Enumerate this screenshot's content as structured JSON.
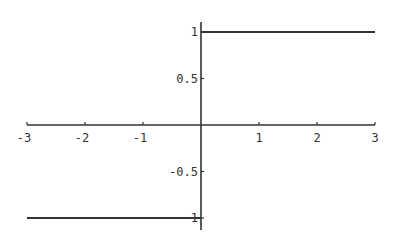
{
  "chart_data": {
    "type": "line",
    "title": "",
    "xlabel": "",
    "ylabel": "",
    "xlim": [
      -3,
      3
    ],
    "ylim": [
      -1,
      1
    ],
    "grid": false,
    "legend": null,
    "axes_origin": [
      0,
      0
    ],
    "x_ticks": [
      -3,
      -2,
      -1,
      1,
      2,
      3
    ],
    "x_tick_labels": [
      "-3",
      "-2",
      "-1",
      "1",
      "2",
      "3"
    ],
    "y_ticks": [
      1,
      0.5,
      -0.5,
      -1
    ],
    "y_tick_labels": [
      "1",
      "0.5",
      "-0.5",
      "1"
    ],
    "series": [
      {
        "name": "step function",
        "description": "y = -1 for x < 0, y = 1 for x > 0 (sign / step function)",
        "segments": [
          {
            "x": [
              -3,
              0
            ],
            "y": [
              -1,
              -1
            ]
          },
          {
            "x": [
              0,
              3
            ],
            "y": [
              1,
              1
            ]
          }
        ],
        "color": "#333333"
      }
    ]
  },
  "style": {
    "axis_color": "#333333",
    "line_color": "#333333",
    "background": "#ffffff"
  }
}
